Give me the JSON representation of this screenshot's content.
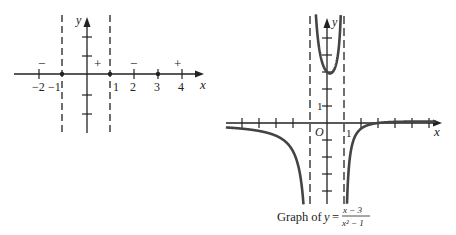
{
  "left_diagram": {
    "description": "Sign chart for (x-3)/(x^2-1)",
    "x_axis_label": "x",
    "y_axis_label": "y",
    "x_ticks": [
      {
        "value": -2,
        "label": "−2"
      },
      {
        "value": -1,
        "label": "−1"
      },
      {
        "value": 1,
        "label": "1"
      },
      {
        "value": 2,
        "label": "2"
      },
      {
        "value": 3,
        "label": "3"
      },
      {
        "value": 4,
        "label": "4"
      }
    ],
    "marked_points": [
      -1,
      1,
      3
    ],
    "asymptotes": [
      -1,
      1
    ],
    "sign_intervals": [
      {
        "interval": "x < -1",
        "sign": "−"
      },
      {
        "interval": "-1 < x < 1",
        "sign": "+"
      },
      {
        "interval": "1 < x < 3",
        "sign": "−"
      },
      {
        "interval": "x > 3",
        "sign": "+"
      }
    ]
  },
  "right_diagram": {
    "x_axis_label": "x",
    "y_axis_label": "y",
    "origin_label": "O",
    "x_tick_label": "1",
    "y_tick_label": "1",
    "asymptotes": [
      -1,
      1
    ],
    "caption_prefix": "Graph of",
    "caption_var": "y",
    "caption_eq": "=",
    "caption_numerator": "x − 3",
    "caption_denominator": "x² − 1"
  },
  "chart_data": {
    "type": "line",
    "xlabel": "x",
    "ylabel": "y",
    "function": "(x-3)/(x^2-1)",
    "vertical_asymptotes": [
      -1,
      1
    ],
    "horizontal_asymptote": 0,
    "local_min_middle_branch": {
      "x": 0.17,
      "y": 2.91
    },
    "y_intercept": 3,
    "x_intercept": 3,
    "xlim": [
      -6,
      6.5
    ],
    "ylim": [
      -5,
      6.5
    ]
  }
}
